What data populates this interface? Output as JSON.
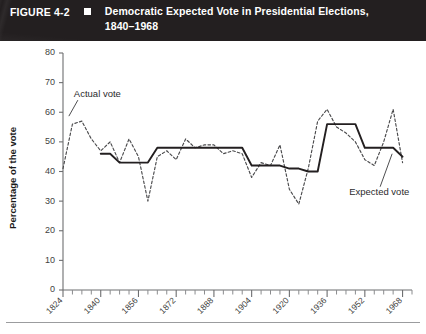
{
  "header": {
    "figure_number": "FIGURE 4-2",
    "marker_icon": "filled-square-icon",
    "title_line1": "Democratic Expected Vote in Presidential Elections,",
    "title_line2": "1840–1968",
    "background_color": "#231f20",
    "text_color": "#ffffff"
  },
  "chart_data": {
    "type": "line",
    "title": "Democratic Expected Vote in Presidential Elections, 1840–1968",
    "xlabel": "",
    "ylabel": "Percentage of the vote",
    "xlim": [
      1824,
      1972
    ],
    "ylim": [
      0,
      80
    ],
    "ytick_step": 10,
    "yticks": [
      0,
      10,
      20,
      30,
      40,
      50,
      60,
      70,
      80
    ],
    "xticks_major": [
      1824,
      1840,
      1856,
      1872,
      1888,
      1904,
      1920,
      1936,
      1952,
      1968
    ],
    "xtick_minor_step": 4,
    "grid": false,
    "legend_position": "inline-annotations",
    "annotations": [
      {
        "text": "Actual vote",
        "points_to_series": "Actual vote",
        "x_data": 1832,
        "y_data": 57
      },
      {
        "text": "Expected vote",
        "points_to_series": "Expected vote",
        "x_data": 1964,
        "y_data": 47
      }
    ],
    "x": [
      1824,
      1828,
      1832,
      1836,
      1840,
      1844,
      1848,
      1852,
      1856,
      1860,
      1864,
      1868,
      1872,
      1876,
      1880,
      1884,
      1888,
      1892,
      1896,
      1900,
      1904,
      1908,
      1912,
      1916,
      1920,
      1924,
      1928,
      1932,
      1936,
      1940,
      1944,
      1948,
      1952,
      1956,
      1960,
      1964,
      1968
    ],
    "series": [
      {
        "name": "Actual vote",
        "style": "dashed",
        "color": "#4a4a4c",
        "values": [
          41,
          56,
          57,
          51,
          47,
          50,
          43,
          51,
          45,
          30,
          45,
          47,
          44,
          51,
          48,
          49,
          49,
          46,
          47,
          46,
          38,
          43,
          42,
          49,
          34,
          29,
          41,
          57,
          61,
          55,
          53,
          50,
          44,
          42,
          50,
          61,
          43
        ]
      },
      {
        "name": "Expected vote",
        "style": "solid",
        "color": "#231f20",
        "values": [
          null,
          null,
          null,
          null,
          46,
          46,
          43,
          43,
          43,
          43,
          48,
          48,
          48,
          48,
          48,
          48,
          48,
          48,
          48,
          48,
          42,
          42,
          42,
          42,
          41,
          41,
          40,
          40,
          56,
          56,
          56,
          56,
          48,
          48,
          48,
          48,
          45
        ]
      }
    ]
  }
}
